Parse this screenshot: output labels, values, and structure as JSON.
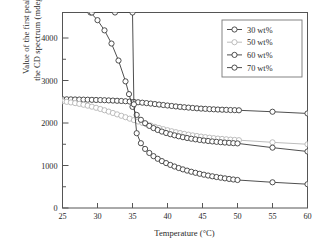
{
  "chart_data": {
    "type": "line",
    "title": "",
    "xlabel": "Temperature (°C)",
    "ylabel": "Value of the first peak of\nthe CD spectrum (mdeg/µm)",
    "ylabel_line1": "Value of the first peak of",
    "ylabel_line2": "the CD spectrum (mdeg/µm)",
    "xlim": [
      25,
      60
    ],
    "ylim": [
      0,
      4600
    ],
    "xticks": [
      25,
      30,
      35,
      40,
      45,
      50,
      55,
      60
    ],
    "xtick_labels": [
      "25",
      "30",
      "35",
      "40",
      "45",
      "50",
      "55",
      "60"
    ],
    "yticks": [
      0,
      1000,
      2000,
      3000,
      4000
    ],
    "ytick_labels": [
      "0",
      "1000",
      "2000",
      "3000",
      "4000"
    ],
    "yminor_ticks": [
      500,
      1500,
      2500,
      3500
    ],
    "xminor_ticks": [],
    "grid": false,
    "legend_position": "top-right",
    "marker": "open-circle",
    "series": [
      {
        "name": "30 wt%",
        "color": "#3b3b3b",
        "x": [
          25,
          25.6,
          26.2,
          26.8,
          27.4,
          28,
          28.6,
          29.2,
          29.8,
          30.4,
          31,
          31.6,
          32.2,
          32.8,
          33.4,
          34,
          34.6,
          35.2,
          35.8,
          36.4,
          37,
          37.6,
          38.2,
          38.8,
          39.4,
          40,
          40.6,
          41.2,
          41.8,
          42.4,
          43,
          43.6,
          44.2,
          44.8,
          45.4,
          46,
          46.6,
          47.2,
          47.8,
          48.4,
          49,
          49.6,
          50.2,
          55,
          60
        ],
        "values": [
          2560,
          2558,
          2556,
          2554,
          2552,
          2550,
          2548,
          2545,
          2542,
          2540,
          2536,
          2532,
          2528,
          2523,
          2518,
          2512,
          2505,
          2497,
          2488,
          2478,
          2468,
          2457,
          2446,
          2434,
          2423,
          2412,
          2401,
          2390,
          2380,
          2371,
          2362,
          2354,
          2346,
          2339,
          2333,
          2327,
          2322,
          2317,
          2313,
          2309,
          2305,
          2302,
          2299,
          2265,
          2225
        ]
      },
      {
        "name": "50 wt%",
        "color": "#b5b5b5",
        "x": [
          25,
          25.6,
          26.2,
          26.8,
          27.4,
          28,
          28.6,
          29.2,
          29.8,
          30.4,
          31,
          31.6,
          32.2,
          32.8,
          33.4,
          34,
          34.6,
          35.2,
          35.8,
          36.4,
          37,
          37.6,
          38.2,
          38.8,
          39.4,
          40,
          40.6,
          41.2,
          41.8,
          42.4,
          43,
          43.6,
          44.2,
          44.8,
          45.4,
          46,
          46.6,
          47.2,
          47.8,
          48.4,
          49,
          49.6,
          50.2,
          55,
          60
        ],
        "values": [
          2510,
          2498,
          2484,
          2468,
          2450,
          2430,
          2408,
          2384,
          2358,
          2330,
          2300,
          2268,
          2236,
          2203,
          2170,
          2136,
          2102,
          2068,
          2035,
          2002,
          1970,
          1940,
          1910,
          1882,
          1855,
          1830,
          1806,
          1784,
          1763,
          1744,
          1726,
          1709,
          1694,
          1680,
          1667,
          1655,
          1644,
          1634,
          1625,
          1617,
          1609,
          1602,
          1596,
          1545,
          1500
        ]
      },
      {
        "name": "60 wt%",
        "color": "#3b3b3b",
        "x": [
          29,
          30,
          31,
          32,
          33,
          34,
          34.5,
          35,
          35.6,
          36.2,
          36.8,
          37.4,
          38,
          38.6,
          39.2,
          39.8,
          40.4,
          41,
          41.6,
          42.2,
          42.8,
          43.4,
          44,
          44.6,
          45.2,
          45.8,
          46.4,
          47,
          47.6,
          48.2,
          48.8,
          49.4,
          50,
          55,
          60
        ],
        "values": [
          4600,
          4420,
          4180,
          3870,
          3470,
          2980,
          2680,
          2380,
          2190,
          2075,
          1995,
          1932,
          1880,
          1836,
          1798,
          1765,
          1736,
          1710,
          1687,
          1666,
          1647,
          1630,
          1615,
          1601,
          1588,
          1577,
          1566,
          1557,
          1548,
          1540,
          1533,
          1526,
          1520,
          1420,
          1330
        ]
      },
      {
        "name": "70 wt%",
        "color": "#3b3b3b",
        "x": [
          29.2,
          32.5,
          35,
          35.2,
          35.6,
          36.2,
          36.8,
          37.4,
          38,
          38.6,
          39.2,
          39.8,
          40.4,
          41,
          41.6,
          42.2,
          42.8,
          43.4,
          44,
          44.6,
          45.2,
          45.8,
          46.4,
          47,
          47.6,
          48.2,
          48.8,
          49.4,
          50,
          55,
          60
        ],
        "values": [
          4600,
          4600,
          4600,
          2440,
          1760,
          1525,
          1390,
          1295,
          1220,
          1158,
          1104,
          1057,
          1014,
          976,
          941,
          909,
          880,
          853,
          828,
          805,
          784,
          764,
          746,
          729,
          713,
          698,
          684,
          671,
          659,
          605,
          560
        ]
      }
    ]
  },
  "legend": {
    "entries": [
      {
        "label": "30 wt%"
      },
      {
        "label": "50 wt%"
      },
      {
        "label": "60 wt%"
      },
      {
        "label": "70 wt%"
      }
    ]
  },
  "axes": {
    "x_title": "Temperature (°C)",
    "y_title_line1": "Value of the first peak of",
    "y_title_line2": "the CD spectrum (mdeg/µm)"
  }
}
